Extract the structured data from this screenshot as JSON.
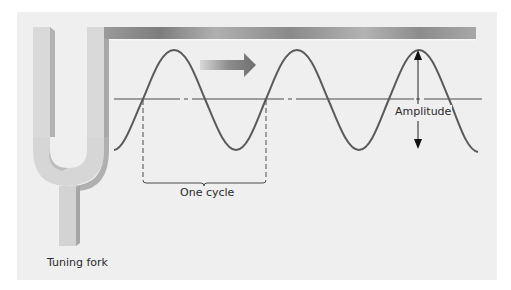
{
  "diagram": {
    "labels": {
      "tuning_fork": "Tuning fork",
      "one_cycle": "One cycle",
      "amplitude": "Amplitude"
    },
    "elements": {
      "tuning_fork": "tuning-fork-illustration",
      "direction_arrow": "arrow-right-icon",
      "wave": "sine-wave",
      "baseline": "dash-dot-axis",
      "amplitude_arrow": "double-arrow-vertical",
      "cycle_bracket": "dashed-bracket"
    },
    "colors": {
      "panel_background": "#efefef",
      "fork": "#d6d6d6",
      "fork_shadow": "#a9a9a9",
      "wave_stroke": "#5a5a5a",
      "baseline": "#4a4a4a",
      "label_text": "#2a2a2a"
    }
  }
}
